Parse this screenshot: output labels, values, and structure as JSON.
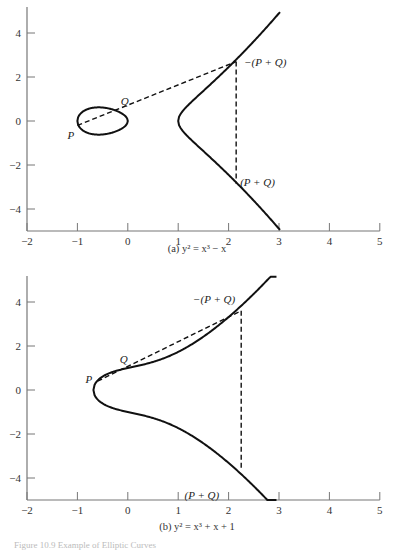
{
  "chart_data": [
    {
      "type": "line",
      "title": "(a) y² = x³ − x",
      "equation": "y^2 = x^3 - x",
      "xlim": [
        -2,
        5
      ],
      "ylim": [
        -5,
        5
      ],
      "xticks": [
        -2,
        -1,
        0,
        1,
        2,
        3,
        4,
        5
      ],
      "yticks": [
        -4,
        -2,
        0,
        2,
        4
      ],
      "grid": false,
      "series": [
        {
          "name": "curve",
          "style": "solid",
          "note": "closed oval for x in [-1,0]; unbounded branch x>=1"
        },
        {
          "name": "secant P-Q",
          "style": "dashed",
          "x": [
            -1.0,
            2.15
          ],
          "y": [
            -0.2,
            2.7
          ]
        },
        {
          "name": "vertical reflection",
          "style": "dashed",
          "x": [
            2.15,
            2.15
          ],
          "y": [
            2.7,
            -2.85
          ]
        }
      ],
      "points": [
        {
          "label": "P",
          "x": -1.0,
          "y": -0.2
        },
        {
          "label": "Q",
          "x": -0.1,
          "y": 0.5
        },
        {
          "label": "−(P + Q)",
          "x": 2.15,
          "y": 2.7
        },
        {
          "label": "(P + Q)",
          "x": 2.15,
          "y": -2.85
        }
      ]
    },
    {
      "type": "line",
      "title": "(b) y² = x³ + x + 1",
      "equation": "y^2 = x^3 + x + 1",
      "xlim": [
        -2,
        5
      ],
      "ylim": [
        -5,
        5
      ],
      "xticks": [
        -2,
        -1,
        0,
        1,
        2,
        3,
        4,
        5
      ],
      "yticks": [
        -4,
        -2,
        0,
        2,
        4
      ],
      "grid": false,
      "series": [
        {
          "name": "curve",
          "style": "solid",
          "note": "single branch, x >= -0.68"
        },
        {
          "name": "secant P-Q",
          "style": "dashed",
          "x": [
            -0.6,
            2.25
          ],
          "y": [
            0.4,
            3.6
          ]
        },
        {
          "name": "vertical reflection",
          "style": "dashed",
          "x": [
            2.25,
            2.25
          ],
          "y": [
            3.6,
            -3.6
          ]
        }
      ],
      "points": [
        {
          "label": "P",
          "x": -0.6,
          "y": 0.4
        },
        {
          "label": "Q",
          "x": 0.0,
          "y": 1.0
        },
        {
          "label": "−(P + Q)",
          "x": 2.25,
          "y": 3.6
        },
        {
          "label": "(P + Q)",
          "x": 2.25,
          "y": -3.6
        }
      ]
    }
  ],
  "captions": {
    "a": "(a) y² = x³ − x",
    "b": "(b) y² = x³ + x + 1",
    "figure": "Figure 10.9   Example of Elliptic Curves"
  },
  "labels": {
    "P": "P",
    "Q": "Q",
    "neg_sum": "−(P + Q)",
    "sum": "(P + Q)"
  }
}
